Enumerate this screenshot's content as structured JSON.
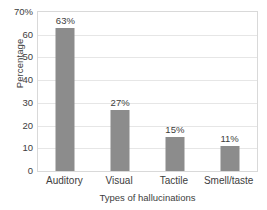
{
  "chart_data": {
    "type": "bar",
    "title": "",
    "subtitle": "",
    "categories": [
      "Auditory",
      "Visual",
      "Tactile",
      "Smell/taste"
    ],
    "values": [
      63,
      27,
      15,
      11
    ],
    "value_labels": [
      "63%",
      "27%",
      "15%",
      "11%"
    ],
    "xlabel": "Types of hallucinations",
    "ylabel": "Percentage",
    "ylim": [
      0,
      70
    ],
    "xlim": [
      0,
      4
    ],
    "y_ticks": [
      0,
      10,
      20,
      30,
      40,
      50,
      60,
      70
    ],
    "y_tick_labels": [
      "0",
      "10",
      "20",
      "30",
      "40",
      "50",
      "60",
      "70%"
    ],
    "grid": true,
    "grid_axis": "y",
    "legend": false,
    "legend_position": "none",
    "bar_color": "#8c8c8c",
    "grid_color": "#e6e6e6",
    "axis_color": "#d9d9d9",
    "background_color": "#ffffff",
    "text_color": "#3d3d3d"
  }
}
